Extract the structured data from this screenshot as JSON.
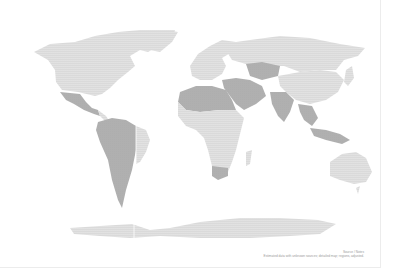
{
  "map": {
    "type": "dotted world map",
    "colors": {
      "land": "#c9c9c9",
      "highlight": "#9c9c9c",
      "background": "#ffffff"
    },
    "highlighted_regions": [
      "Mexico",
      "Western South America",
      "Brazil (east)",
      "North Africa / Sahara",
      "Middle East",
      "Kazakhstan",
      "India",
      "Southeast Asia",
      "Southern Africa"
    ]
  },
  "footer": {
    "line1": "Source / Notes",
    "line2": "Estimated data with unknown sources; detailed map; regions, adjusted."
  }
}
